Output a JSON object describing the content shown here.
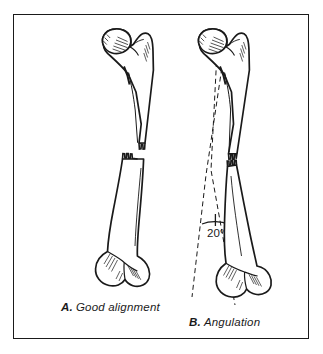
{
  "figure": {
    "background_color": "#ffffff",
    "ink_color": "#1a1a1a",
    "frame": {
      "border_color": "#1a1a1a",
      "border_width_px": 1.6
    },
    "panels": [
      {
        "id": "A",
        "letter": "A.",
        "caption": "Good alignment",
        "description": "Femur with transverse mid-shaft fracture, fragments in anatomic alignment",
        "bone": "femur",
        "fracture_type": "transverse",
        "angulation_degrees": 0,
        "has_axis_lines": false
      },
      {
        "id": "B",
        "letter": "B.",
        "caption": "Angulation",
        "description": "Femur with transverse mid-shaft fracture, distal fragment angulated",
        "bone": "femur",
        "fracture_type": "transverse",
        "angulation_degrees": 20,
        "has_axis_lines": true
      }
    ],
    "annotations": {
      "angle_value": "20°",
      "angle_marker": "arc-with-tick"
    }
  }
}
